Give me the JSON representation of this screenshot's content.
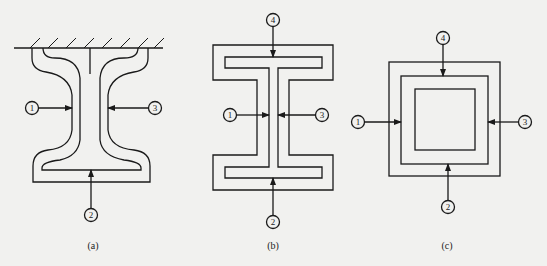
{
  "figure": {
    "panels": [
      {
        "id": "a",
        "caption": "(a)",
        "shape": "I-beam with curved profile attached to fixed wall",
        "markers": [
          "1",
          "3",
          "2"
        ]
      },
      {
        "id": "b",
        "caption": "(b)",
        "shape": "I-beam rectangular profile",
        "markers": [
          "4",
          "1",
          "3",
          "2"
        ]
      },
      {
        "id": "c",
        "caption": "(c)",
        "shape": "Square hollow section",
        "markers": [
          "4",
          "1",
          "3",
          "2"
        ]
      }
    ],
    "colors": {
      "line": "#1a1a1a",
      "background": "#f1f1ef"
    }
  }
}
